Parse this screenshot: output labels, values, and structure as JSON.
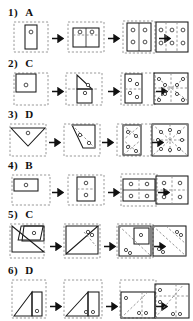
{
  "worksheet": {
    "type": "paper-folding-hole-punch-answer-key",
    "problem_count": 6,
    "stages_per_problem": 4,
    "arrow_glyph": "right-arrow",
    "colors": {
      "paper_outline_solid": "#1a1a1a",
      "fold_line_dashed": "#8a8a8a",
      "hidden_outline_dashed": "#9a9a9a",
      "hole_fill": "#ffffff",
      "background": "#ffffff",
      "text": "#111111"
    }
  },
  "problems": [
    {
      "number": "1)",
      "answer": "A",
      "stage_labels": [
        "folded",
        "unfold-1",
        "unfold-2",
        "unfold-3"
      ],
      "hole_counts": [
        1,
        2,
        4,
        6
      ],
      "final_hole_grid": "3 columns x 2 rows"
    },
    {
      "number": "2)",
      "answer": "C",
      "stage_labels": [
        "folded",
        "unfold-1",
        "unfold-2",
        "unfold-3"
      ],
      "hole_counts": [
        1,
        2,
        4,
        8
      ],
      "final_hole_grid": "radial about center"
    },
    {
      "number": "3)",
      "answer": "D",
      "stage_labels": [
        "folded",
        "unfold-1",
        "unfold-2",
        "unfold-3"
      ],
      "hole_counts": [
        1,
        2,
        4,
        8
      ],
      "final_hole_grid": "8-point star about center"
    },
    {
      "number": "4)",
      "answer": "B",
      "stage_labels": [
        "folded",
        "unfold-1",
        "unfold-2",
        "unfold-3"
      ],
      "hole_counts": [
        1,
        2,
        4,
        4
      ],
      "final_hole_grid": "2 columns x 2 rows"
    },
    {
      "number": "5)",
      "answer": "C",
      "stage_labels": [
        "folded",
        "unfold-1",
        "unfold-2",
        "unfold-3"
      ],
      "hole_counts": [
        1,
        2,
        3,
        4
      ],
      "final_hole_grid": "pairs along diagonal"
    },
    {
      "number": "6)",
      "answer": "D",
      "stage_labels": [
        "folded",
        "unfold-1",
        "unfold-2",
        "unfold-3"
      ],
      "hole_counts": [
        1,
        2,
        3,
        4
      ],
      "final_hole_grid": "scattered with diagonal"
    }
  ]
}
